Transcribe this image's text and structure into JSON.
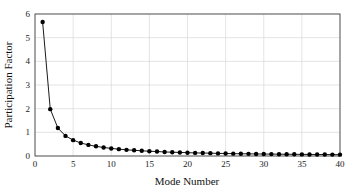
{
  "chart_data": {
    "type": "line",
    "title": "",
    "xlabel": "Mode Number",
    "ylabel": "Participation Factor",
    "xlim": [
      0,
      40
    ],
    "ylim": [
      0,
      6
    ],
    "xticks": [
      0,
      5,
      10,
      15,
      20,
      25,
      30,
      35,
      40
    ],
    "yticks": [
      0,
      1,
      2,
      3,
      4,
      5,
      6
    ],
    "grid": true,
    "legend": null,
    "series": [
      {
        "name": "Participation Factor",
        "color": "#000000",
        "marker": "circle",
        "x": [
          1,
          2,
          3,
          4,
          5,
          6,
          7,
          8,
          9,
          10,
          11,
          12,
          13,
          14,
          15,
          16,
          17,
          18,
          19,
          20,
          21,
          22,
          23,
          24,
          25,
          26,
          27,
          28,
          29,
          30,
          31,
          32,
          33,
          34,
          35,
          36,
          37,
          38,
          39,
          40
        ],
        "values": [
          5.66,
          1.98,
          1.18,
          0.85,
          0.67,
          0.55,
          0.47,
          0.41,
          0.36,
          0.32,
          0.29,
          0.26,
          0.24,
          0.22,
          0.2,
          0.19,
          0.17,
          0.16,
          0.15,
          0.14,
          0.13,
          0.125,
          0.12,
          0.11,
          0.105,
          0.1,
          0.095,
          0.09,
          0.087,
          0.083,
          0.08,
          0.077,
          0.074,
          0.071,
          0.068,
          0.066,
          0.063,
          0.061,
          0.059,
          0.057
        ]
      }
    ]
  }
}
